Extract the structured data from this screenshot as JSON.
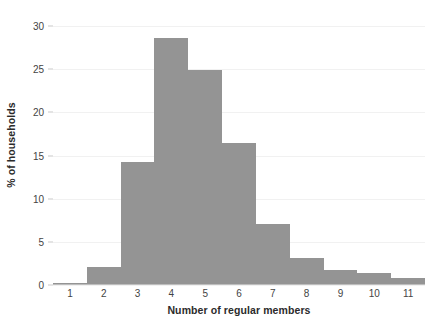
{
  "chart_data": {
    "type": "bar",
    "title": "",
    "subtitle": "",
    "xlabel": "Number of regular members",
    "ylabel": "% of households",
    "categories": [
      "1",
      "2",
      "3",
      "4",
      "5",
      "6",
      "7",
      "8",
      "9",
      "10",
      "11"
    ],
    "values": [
      0.2,
      2.1,
      14.3,
      28.6,
      24.9,
      16.4,
      7.1,
      3.1,
      1.7,
      1.4,
      0.8
    ],
    "series": [
      {
        "name": "% of households",
        "values": [
          0.2,
          2.1,
          14.3,
          28.6,
          24.9,
          16.4,
          7.1,
          3.1,
          1.7,
          1.4,
          0.8
        ]
      }
    ],
    "xlim": [
      0.5,
      11.5
    ],
    "ylim": [
      0,
      30
    ],
    "y_ticks": [
      0,
      5,
      10,
      15,
      20,
      25,
      30
    ],
    "y_tick_labels": [
      "0",
      "5",
      "10",
      "15",
      "20",
      "25",
      "30"
    ],
    "x_ticks": [
      1,
      2,
      3,
      4,
      5,
      6,
      7,
      8,
      9,
      10,
      11
    ],
    "x_tick_labels": [
      "1",
      "2",
      "3",
      "4",
      "5",
      "6",
      "7",
      "8",
      "9",
      "10",
      "11"
    ],
    "grid": true,
    "grid_axis": "y",
    "legend": false,
    "legend_position": "none",
    "bar_color": "#949494",
    "gridline_color": "#f1f1f1",
    "axis_color": "#bdbdbd",
    "text_color": "#444444",
    "title_color": "#2b2b2b",
    "background": "#ffffff",
    "bar_gap": 0,
    "annotations": []
  }
}
